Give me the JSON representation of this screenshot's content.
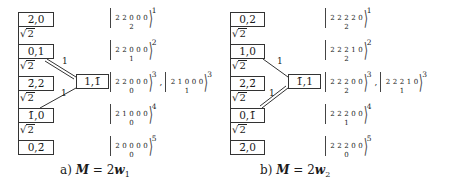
{
  "panels": [
    {
      "id": "a",
      "nodes": [
        "2,0",
        "0,1",
        "2̄,2",
        "1̄,0",
        "0,2̄"
      ],
      "chain_edge_labels": [
        "√2",
        "√2",
        "√2",
        "√2"
      ],
      "side_node": "1,1̄",
      "side_edges": [
        {
          "from": "0,1",
          "label": "1",
          "style": "double"
        },
        {
          "from": "2̄,2",
          "label": "1",
          "style": "single"
        }
      ],
      "kets": [
        {
          "top": [
            "2",
            "2",
            "0",
            "0",
            "0"
          ],
          "middle": "2",
          "sup": "1"
        },
        {
          "top": [
            "2",
            "2",
            "0",
            "0",
            "0"
          ],
          "middle": "1",
          "sup": "2"
        },
        {
          "top": [
            "2",
            "2",
            "0",
            "0",
            "0"
          ],
          "middle": "0",
          "sup": "3",
          "second": {
            "top": [
              "2",
              "1",
              "0",
              "0",
              "0"
            ],
            "middle": "1",
            "sup": "3"
          }
        },
        {
          "top": [
            "2",
            "1",
            "0",
            "0",
            "0"
          ],
          "middle": "0",
          "sup": "4"
        },
        {
          "top": [
            "2",
            "0",
            "0",
            "0",
            "0"
          ],
          "middle": "0",
          "sup": "5"
        }
      ],
      "caption": {
        "prefix": "a)",
        "lhs": "M",
        "eq": "= 2",
        "rhs": "w",
        "sub": "1"
      }
    },
    {
      "id": "b",
      "nodes": [
        "0,2",
        "1,0",
        "2,2̄",
        "0,1̄",
        "2̄,0"
      ],
      "chain_edge_labels": [
        "√2",
        "√2",
        "√2",
        "√2"
      ],
      "side_node": "1̄,1",
      "side_edges": [
        {
          "from": "1,0",
          "label": "1",
          "style": "single"
        },
        {
          "from": "0,1̄",
          "label": "1",
          "style": "double"
        }
      ],
      "kets": [
        {
          "top": [
            "2",
            "2",
            "2",
            "2",
            "0"
          ],
          "middle": "2",
          "sup": "1"
        },
        {
          "top": [
            "2",
            "2",
            "2",
            "1",
            "0"
          ],
          "middle": "2",
          "sup": "2"
        },
        {
          "top": [
            "2",
            "2",
            "2",
            "0",
            "0"
          ],
          "middle": "2",
          "sup": "3",
          "second": {
            "top": [
              "2",
              "2",
              "2",
              "1",
              "0"
            ],
            "middle": "1",
            "sup": "3"
          }
        },
        {
          "top": [
            "2",
            "2",
            "2",
            "0",
            "0"
          ],
          "middle": "1",
          "sup": "4"
        },
        {
          "top": [
            "2",
            "2",
            "2",
            "0",
            "0"
          ],
          "middle": "0",
          "sup": "5"
        }
      ],
      "caption": {
        "prefix": "b)",
        "lhs": "M",
        "eq": "= 2",
        "rhs": "w",
        "sub": "2"
      }
    }
  ]
}
